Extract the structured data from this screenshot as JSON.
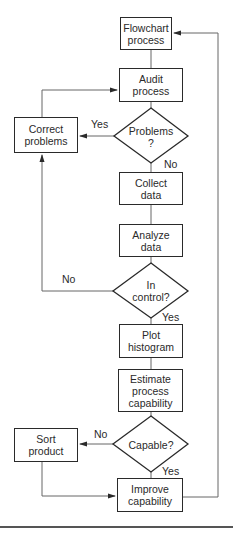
{
  "flowchart": {
    "nodes": {
      "flowchart_process": {
        "line1": "Flowchart",
        "line2": "process"
      },
      "audit_process": {
        "line1": "Audit",
        "line2": "process"
      },
      "problems": {
        "line1": "Problems",
        "line2": "?"
      },
      "correct_problems": {
        "line1": "Correct",
        "line2": "problems"
      },
      "collect_data": {
        "line1": "Collect",
        "line2": "data"
      },
      "analyze_data": {
        "line1": "Analyze",
        "line2": "data"
      },
      "in_control": {
        "line1": "In",
        "line2": "control?"
      },
      "plot_histogram": {
        "line1": "Plot",
        "line2": "histogram"
      },
      "estimate_capability": {
        "line1": "Estimate",
        "line2": "process",
        "line3": "capability"
      },
      "capable": {
        "line1": "Capable?"
      },
      "sort_product": {
        "line1": "Sort",
        "line2": "product"
      },
      "improve_capability": {
        "line1": "Improve",
        "line2": "capability"
      }
    },
    "edge_labels": {
      "problems_yes": "Yes",
      "problems_no": "No",
      "in_control_no": "No",
      "in_control_yes": "Yes",
      "capable_no": "No",
      "capable_yes": "Yes"
    },
    "colors": {
      "stroke": "#2a2a2a",
      "connector": "#555555",
      "background": "#ffffff"
    }
  }
}
